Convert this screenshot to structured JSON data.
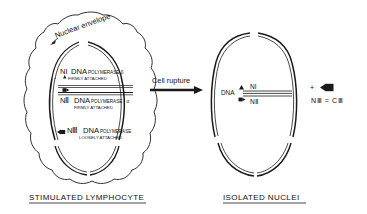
{
  "figure": {
    "left_panel": {
      "caption": "STIMULATED   LYMPHOCYTE",
      "envelope_label": "Nuclear envelope",
      "entries": [
        {
          "marker": "triangle",
          "name": "NI",
          "enzyme": "DNA",
          "detail": "POLYMERASE-β",
          "attachment": "FIRMLY ATTACHED"
        },
        {
          "marker": "square",
          "name": "NⅡ",
          "enzyme": "DNA",
          "detail": "POLYMERASE - α",
          "attachment": "FIRMLY ATTACHED"
        },
        {
          "marker": "flag",
          "name": "NⅢ",
          "enzyme": "DNA",
          "detail": "POLYMERASE",
          "attachment": "LOOSELY ATTACHED"
        }
      ]
    },
    "transition": {
      "label": "Cell  rupture"
    },
    "right_panel": {
      "caption": "ISOLATED   NUCLEI",
      "dna_label": "DNA",
      "bound": [
        {
          "marker": "triangle",
          "name": "NI"
        },
        {
          "marker": "square",
          "name": "NⅡ"
        }
      ],
      "released": {
        "plus": "+",
        "marker": "flag",
        "equation": "NⅢ = CⅢ"
      }
    },
    "colors": {
      "ink": "#1a1a1a",
      "paper": "#ffffff"
    }
  }
}
